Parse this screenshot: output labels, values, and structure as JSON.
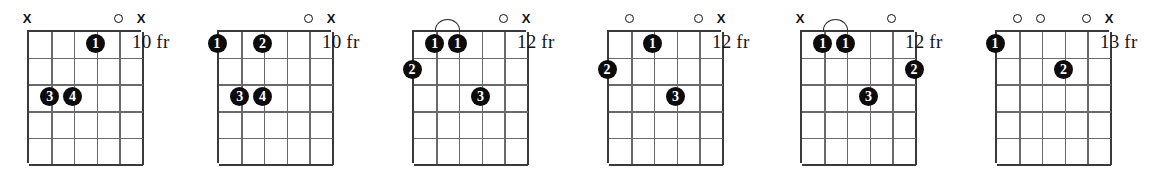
{
  "page": {
    "background_color": "#ffffff",
    "ink_color": "#111111",
    "dot_color": "#0c0c0c",
    "dot_text_color": "#ffffff",
    "grid_color": "#6a6a6a",
    "diagram_count": 6,
    "strings": 6,
    "frets": 5
  },
  "symbols": {
    "muted": "X",
    "open": "O",
    "fret_suffix": "fr"
  },
  "diagrams": [
    {
      "id": "chord-1",
      "position_label": "10 fr",
      "fret_number": 10,
      "left": 27,
      "width": 114,
      "label_left": 132,
      "string_markers": [
        {
          "string": 6,
          "type": "X"
        },
        {
          "string": 5,
          "type": ""
        },
        {
          "string": 4,
          "type": ""
        },
        {
          "string": 3,
          "type": ""
        },
        {
          "string": 2,
          "type": "O"
        },
        {
          "string": 1,
          "type": "X"
        }
      ],
      "fingers": [
        {
          "finger": "1",
          "string": 3,
          "fret": 1
        },
        {
          "finger": "3",
          "string": 5,
          "fret": 3
        },
        {
          "finger": "4",
          "string": 4,
          "fret": 3
        }
      ],
      "barres": []
    },
    {
      "id": "chord-2",
      "position_label": "10 fr",
      "fret_number": 10,
      "left": 217,
      "width": 114,
      "label_left": 322,
      "string_markers": [
        {
          "string": 6,
          "type": ""
        },
        {
          "string": 5,
          "type": ""
        },
        {
          "string": 4,
          "type": ""
        },
        {
          "string": 3,
          "type": ""
        },
        {
          "string": 2,
          "type": "O"
        },
        {
          "string": 1,
          "type": "X"
        }
      ],
      "fingers": [
        {
          "finger": "1",
          "string": 6,
          "fret": 1
        },
        {
          "finger": "2",
          "string": 4,
          "fret": 1
        },
        {
          "finger": "3",
          "string": 5,
          "fret": 3
        },
        {
          "finger": "4",
          "string": 4,
          "fret": 3
        }
      ],
      "barres": []
    },
    {
      "id": "chord-3",
      "position_label": "12 fr",
      "fret_number": 12,
      "left": 412,
      "width": 114,
      "label_left": 517,
      "string_markers": [
        {
          "string": 6,
          "type": ""
        },
        {
          "string": 5,
          "type": ""
        },
        {
          "string": 4,
          "type": ""
        },
        {
          "string": 3,
          "type": ""
        },
        {
          "string": 2,
          "type": "O"
        },
        {
          "string": 1,
          "type": "X"
        }
      ],
      "fingers": [
        {
          "finger": "1",
          "string": 5,
          "fret": 1
        },
        {
          "finger": "1",
          "string": 4,
          "fret": 1
        },
        {
          "finger": "2",
          "string": 6,
          "fret": 2
        },
        {
          "finger": "3",
          "string": 3,
          "fret": 3
        }
      ],
      "barres": [
        {
          "finger": "1",
          "from_string": 5,
          "to_string": 4,
          "fret": 1
        }
      ]
    },
    {
      "id": "chord-4",
      "position_label": "12 fr",
      "fret_number": 12,
      "left": 607,
      "width": 114,
      "label_left": 712,
      "string_markers": [
        {
          "string": 6,
          "type": ""
        },
        {
          "string": 5,
          "type": "O"
        },
        {
          "string": 4,
          "type": ""
        },
        {
          "string": 3,
          "type": ""
        },
        {
          "string": 2,
          "type": "O"
        },
        {
          "string": 1,
          "type": "X"
        }
      ],
      "fingers": [
        {
          "finger": "1",
          "string": 4,
          "fret": 1
        },
        {
          "finger": "2",
          "string": 6,
          "fret": 2
        },
        {
          "finger": "3",
          "string": 3,
          "fret": 3
        }
      ],
      "barres": []
    },
    {
      "id": "chord-5",
      "position_label": "12 fr",
      "fret_number": 12,
      "left": 800,
      "width": 114,
      "label_left": 905,
      "string_markers": [
        {
          "string": 6,
          "type": "X"
        },
        {
          "string": 5,
          "type": ""
        },
        {
          "string": 4,
          "type": ""
        },
        {
          "string": 3,
          "type": ""
        },
        {
          "string": 2,
          "type": "O"
        },
        {
          "string": 1,
          "type": ""
        }
      ],
      "fingers": [
        {
          "finger": "1",
          "string": 5,
          "fret": 1
        },
        {
          "finger": "1",
          "string": 4,
          "fret": 1
        },
        {
          "finger": "2",
          "string": 1,
          "fret": 2
        },
        {
          "finger": "3",
          "string": 3,
          "fret": 3
        }
      ],
      "barres": [
        {
          "finger": "1",
          "from_string": 5,
          "to_string": 4,
          "fret": 1
        }
      ]
    },
    {
      "id": "chord-6",
      "position_label": "13 fr",
      "fret_number": 13,
      "left": 995,
      "width": 114,
      "label_left": 1100,
      "string_markers": [
        {
          "string": 6,
          "type": ""
        },
        {
          "string": 5,
          "type": "O"
        },
        {
          "string": 4,
          "type": "O"
        },
        {
          "string": 3,
          "type": ""
        },
        {
          "string": 2,
          "type": "O"
        },
        {
          "string": 1,
          "type": "X"
        }
      ],
      "fingers": [
        {
          "finger": "1",
          "string": 6,
          "fret": 1
        },
        {
          "finger": "2",
          "string": 3,
          "fret": 2
        }
      ],
      "barres": []
    }
  ]
}
